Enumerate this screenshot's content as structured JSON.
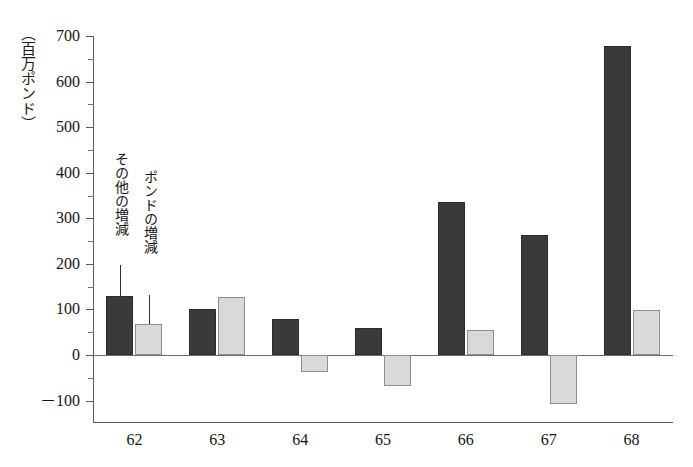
{
  "chart_data": {
    "type": "bar",
    "title": "",
    "subtitle": "",
    "xlabel": "",
    "ylabel": "（百万ポンド）",
    "unit_caption": "（百万ポンド）",
    "categories": [
      "62",
      "63",
      "64",
      "65",
      "66",
      "67",
      "68"
    ],
    "series": [
      {
        "name": "その他の増減",
        "color": "#3a3a3a",
        "values": [
          130,
          100,
          78,
          60,
          336,
          264,
          678
        ]
      },
      {
        "name": "ポンドの増減",
        "color": "#d9d9d9",
        "values": [
          67,
          128,
          -37,
          -68,
          55,
          -107,
          98
        ]
      }
    ],
    "ylim": [
      -100,
      700
    ],
    "y_ticks": [
      700,
      600,
      500,
      400,
      300,
      200,
      100,
      0,
      -100
    ],
    "y_tick_labels": [
      "700",
      "600",
      "500",
      "400",
      "300",
      "200",
      "100",
      "0",
      "－100"
    ],
    "y_minor_ticks": [
      650,
      550,
      450,
      350,
      250,
      150,
      50,
      -50
    ],
    "grid": false,
    "legend_position": "inline-annotation",
    "annotations": [
      {
        "text": "その他の増減",
        "target_series": "その他の増減",
        "target_category": "62"
      },
      {
        "text": "ポンドの増減",
        "target_series": "ポンドの増減",
        "target_category": "62"
      }
    ],
    "zero_line": 0
  }
}
